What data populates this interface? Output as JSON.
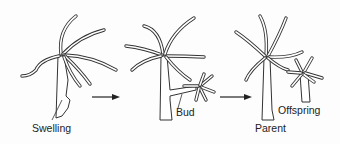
{
  "diagram": {
    "stages": [
      {
        "id": "stage-1",
        "label": "Swelling"
      },
      {
        "id": "stage-2",
        "label": "Bud"
      },
      {
        "id": "stage-3",
        "labels": [
          "Parent",
          "Offspring"
        ]
      }
    ],
    "labels": {
      "swelling": "Swelling",
      "bud": "Bud",
      "parent": "Parent",
      "offspring": "Offspring"
    },
    "arrows": [
      {
        "from": "stage-1",
        "to": "stage-2"
      },
      {
        "from": "stage-2",
        "to": "stage-3"
      }
    ],
    "colors": {
      "stroke": "#333333",
      "background": "#fdfdfd"
    }
  }
}
